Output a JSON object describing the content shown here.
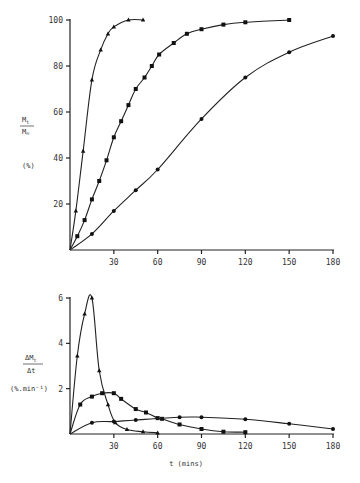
{
  "chart_data": [
    {
      "type": "line",
      "title": "",
      "xlabel": "t (mins)",
      "ylabel": "Mt/M∞ (%)",
      "ylabel_parts": {
        "numerator": "M_t",
        "denominator": "M_∞",
        "unit": "(%)"
      },
      "xlim": [
        0,
        180
      ],
      "ylim": [
        0,
        100
      ],
      "xticks": [
        30,
        60,
        90,
        120,
        150,
        180
      ],
      "yticks": [
        20,
        40,
        60,
        80,
        100
      ],
      "grid": false,
      "legend": null,
      "series": [
        {
          "name": "triangles",
          "marker": "triangle",
          "x": [
            0,
            4,
            9,
            15,
            21,
            26,
            30,
            40,
            50
          ],
          "y": [
            0,
            17,
            43,
            74,
            87,
            94,
            97,
            100,
            100
          ]
        },
        {
          "name": "squares",
          "marker": "square",
          "x": [
            0,
            5,
            10,
            15,
            20,
            25,
            30,
            35,
            40,
            45,
            51,
            56,
            61,
            71,
            80,
            90,
            105,
            120,
            150
          ],
          "y": [
            0,
            6,
            13,
            22,
            30,
            39,
            49,
            56,
            63,
            70,
            75,
            80,
            85,
            90,
            94,
            96,
            98,
            99,
            100
          ]
        },
        {
          "name": "circles",
          "marker": "circle",
          "x": [
            0,
            15,
            30,
            45,
            60,
            90,
            120,
            150,
            180
          ],
          "y": [
            0,
            7,
            17,
            26,
            35,
            57,
            75,
            86,
            93
          ]
        }
      ]
    },
    {
      "type": "line",
      "title": "",
      "xlabel": "t (mins)",
      "ylabel": "ΔMt/Δt (%.min⁻¹)",
      "ylabel_parts": {
        "numerator": "ΔM_t",
        "denominator": "Δt",
        "unit": "(%.min⁻¹)"
      },
      "xlim": [
        0,
        180
      ],
      "ylim": [
        0,
        6
      ],
      "xticks": [
        30,
        60,
        90,
        120,
        150,
        180
      ],
      "yticks": [
        2,
        4,
        6
      ],
      "grid": false,
      "legend": null,
      "series": [
        {
          "name": "triangles",
          "marker": "triangle",
          "x": [
            0,
            5,
            10,
            15,
            20,
            26,
            31,
            39,
            50,
            60
          ],
          "y": [
            0,
            3.45,
            5.3,
            6.0,
            2.8,
            1.3,
            0.5,
            0.2,
            0.1,
            0.05
          ]
        },
        {
          "name": "squares",
          "marker": "square",
          "x": [
            0,
            7,
            15,
            22,
            30,
            35,
            45,
            52,
            60,
            63,
            75,
            90,
            105,
            120
          ],
          "y": [
            0,
            1.3,
            1.65,
            1.8,
            1.8,
            1.55,
            1.1,
            0.95,
            0.7,
            0.67,
            0.42,
            0.22,
            0.1,
            0.08
          ]
        },
        {
          "name": "circles",
          "marker": "circle",
          "x": [
            0,
            15,
            30,
            45,
            75,
            90,
            120,
            150,
            180
          ],
          "y": [
            0,
            0.5,
            0.55,
            0.62,
            0.74,
            0.74,
            0.65,
            0.45,
            0.22
          ]
        }
      ]
    }
  ],
  "labels": {
    "top_y_num": "M",
    "top_y_num_sub": "t",
    "top_y_den": "M",
    "top_y_den_sub": "∞",
    "top_y_unit": "(%)",
    "bot_y_num": "ΔM",
    "bot_y_num_sub": "t",
    "bot_y_den": "Δt",
    "bot_y_unit": "(%.min⁻¹)",
    "x_label": "t (mins)"
  }
}
